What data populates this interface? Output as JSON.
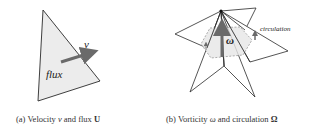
{
  "panels": [
    {
      "id": "a",
      "labels": {
        "velocity": "v",
        "flux": "flux"
      },
      "caption": {
        "prefix": "(a)",
        "text_1": "Velocity",
        "sym_1": "v",
        "text_2": "and flux",
        "sym_2": "U"
      }
    },
    {
      "id": "b",
      "labels": {
        "vorticity": "ω",
        "circulation": "circulation"
      },
      "caption": {
        "prefix": "(b)",
        "text_1": "Vorticity",
        "sym_1": "ω",
        "text_2": "and circulation",
        "sym_2": "Ω"
      }
    }
  ],
  "colors": {
    "fill": "#ececec",
    "stroke": "#2a2a2a",
    "arrow": "#6a6a6a",
    "dashed": "#9a9a9a"
  }
}
